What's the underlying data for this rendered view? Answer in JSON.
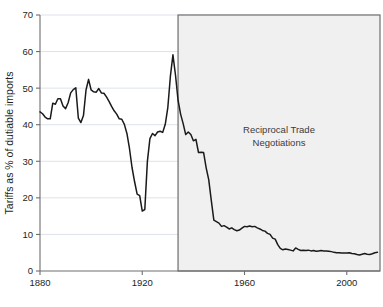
{
  "chart_data": {
    "type": "line",
    "title": "",
    "xlabel": "",
    "ylabel": "Tariffs as % of dutiable imports",
    "xlim": [
      1880,
      2013
    ],
    "ylim": [
      0,
      70
    ],
    "grid": true,
    "legend_position": "none",
    "x_ticks": [
      1880,
      1920,
      1960,
      2000
    ],
    "x_tick_labels": [
      "1880",
      "1920",
      "1960",
      "2000"
    ],
    "y_ticks": [
      0,
      10,
      20,
      30,
      40,
      50,
      60,
      70
    ],
    "y_tick_labels": [
      "0",
      "10",
      "20",
      "30",
      "40",
      "50",
      "60",
      "70"
    ],
    "series": [
      {
        "name": "Tariffs as % of dutiable imports",
        "color": "#1a1a1a",
        "x": [
          1880,
          1881,
          1882,
          1883,
          1884,
          1885,
          1886,
          1887,
          1888,
          1889,
          1890,
          1891,
          1892,
          1893,
          1894,
          1895,
          1896,
          1897,
          1898,
          1899,
          1900,
          1901,
          1902,
          1903,
          1904,
          1905,
          1906,
          1907,
          1908,
          1909,
          1910,
          1911,
          1912,
          1913,
          1914,
          1915,
          1916,
          1917,
          1918,
          1919,
          1920,
          1921,
          1922,
          1923,
          1924,
          1925,
          1926,
          1927,
          1928,
          1929,
          1930,
          1931,
          1932,
          1933,
          1934,
          1935,
          1936,
          1937,
          1938,
          1939,
          1940,
          1941,
          1942,
          1943,
          1944,
          1945,
          1946,
          1947,
          1948,
          1949,
          1950,
          1951,
          1952,
          1953,
          1954,
          1955,
          1956,
          1957,
          1958,
          1959,
          1960,
          1961,
          1962,
          1963,
          1964,
          1965,
          1966,
          1967,
          1968,
          1969,
          1970,
          1971,
          1972,
          1973,
          1974,
          1975,
          1976,
          1977,
          1978,
          1979,
          1980,
          1981,
          1982,
          1983,
          1984,
          1985,
          1986,
          1987,
          1988,
          1989,
          1990,
          1991,
          1992,
          1993,
          1994,
          1995,
          1996,
          1997,
          1998,
          1999,
          2000,
          2001,
          2002,
          2003,
          2004,
          2005,
          2006,
          2007,
          2008,
          2009,
          2010,
          2011,
          2012
        ],
        "values": [
          43.5,
          43.0,
          42.1,
          41.6,
          41.6,
          45.9,
          45.6,
          47.1,
          47.1,
          45.1,
          44.4,
          46.0,
          48.7,
          49.6,
          50.1,
          41.8,
          40.6,
          42.5,
          49.5,
          52.4,
          49.5,
          49.0,
          48.9,
          49.9,
          48.7,
          48.6,
          47.6,
          46.4,
          45.0,
          43.8,
          42.9,
          41.6,
          41.5,
          40.1,
          37.6,
          33.5,
          28.3,
          24.4,
          21.0,
          20.6,
          16.4,
          16.8,
          29.9,
          36.2,
          37.6,
          37.0,
          38.0,
          38.2,
          37.9,
          40.1,
          44.7,
          53.2,
          59.1,
          53.6,
          46.7,
          42.9,
          40.3,
          37.3,
          38.0,
          37.3,
          35.6,
          36.0,
          32.4,
          32.5,
          32.4,
          28.2,
          25.0,
          19.3,
          13.9,
          13.5,
          13.1,
          12.2,
          12.4,
          12.0,
          11.5,
          11.8,
          11.3,
          11.0,
          11.2,
          11.7,
          12.2,
          12.1,
          12.3,
          12.1,
          12.2,
          11.8,
          11.5,
          11.1,
          10.9,
          10.3,
          10.0,
          9.0,
          8.7,
          7.2,
          6.2,
          5.8,
          6.0,
          5.9,
          5.7,
          5.5,
          6.3,
          5.9,
          5.6,
          5.7,
          5.6,
          5.7,
          5.5,
          5.6,
          5.4,
          5.5,
          5.6,
          5.5,
          5.5,
          5.4,
          5.3,
          5.1,
          5.0,
          5.0,
          4.9,
          4.9,
          4.9,
          5.0,
          4.8,
          4.7,
          4.5,
          4.4,
          4.6,
          4.8,
          4.6,
          4.5,
          4.7,
          5.0,
          5.1
        ]
      }
    ],
    "annotations": [
      {
        "name": "reciprocal-trade-negotiations",
        "lines": [
          "Reciprocal Trade",
          "Negotiations"
        ],
        "x_start": 1934,
        "x_end": 2013,
        "y_start": 0,
        "y_end": 70,
        "fill": "#f0f0f0",
        "stroke": "#6e6e6e"
      }
    ]
  },
  "axis": {
    "y_label": "Tariffs as % of dutiable imports"
  },
  "colors": {
    "line": "#1a1a1a",
    "axis": "#6e6e6e",
    "grid": "#d6dbe3",
    "shade_fill": "#f0f0f0",
    "shade_stroke": "#6e6e6e",
    "text": "#231f20",
    "annotation_text": "#3b3b3b",
    "background": "#ffffff"
  }
}
